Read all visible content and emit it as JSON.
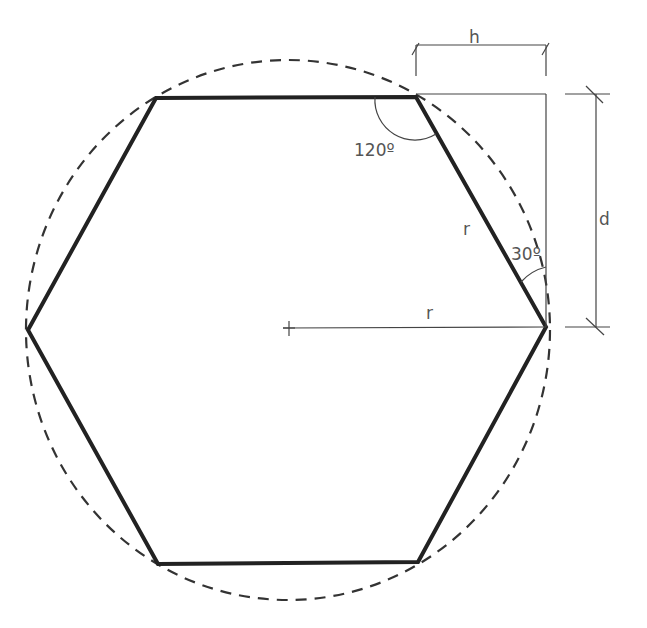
{
  "diagram": {
    "type": "geometry",
    "labels": {
      "angle_top": "120º",
      "angle_side": "30º",
      "radius_slant": "r",
      "radius_horizontal": "r",
      "dimension_h": "h",
      "dimension_d": "d"
    },
    "colors": {
      "hexagon_stroke": "#222222",
      "circle_stroke": "#333333",
      "construction_lines": "#444444",
      "text": "#555555"
    },
    "geometry": {
      "center": [
        288,
        328
      ],
      "circle_radius_x": 262,
      "circle_radius_y": 268,
      "hexagon_vertices": [
        [
          156,
          98
        ],
        [
          416,
          97
        ],
        [
          546,
          327
        ],
        [
          418,
          562
        ],
        [
          158,
          564
        ],
        [
          28,
          330
        ]
      ]
    }
  }
}
